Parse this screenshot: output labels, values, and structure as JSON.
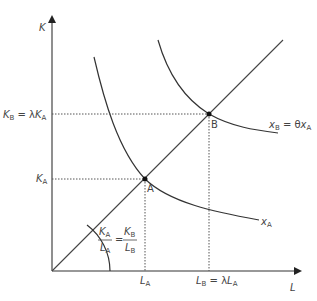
{
  "diagram": {
    "axes": {
      "y_label": "K",
      "x_label": "L"
    },
    "y_ticks": [
      {
        "main": "K",
        "sub": "B",
        "rest": " = λ",
        "main2": "K",
        "sub2": "A"
      },
      {
        "main": "K",
        "sub": "A"
      }
    ],
    "x_ticks": [
      {
        "main": "L",
        "sub": "A"
      },
      {
        "main": "L",
        "sub": "B",
        "rest": " = λ",
        "main2": "L",
        "sub2": "A"
      }
    ],
    "points": [
      {
        "label": "A"
      },
      {
        "label": "B"
      }
    ],
    "curves": [
      {
        "name": "isoquant-A",
        "main": "x",
        "sub": "A"
      },
      {
        "name": "isoquant-B",
        "main": "x",
        "sub": "B",
        "rest": " = θ",
        "main2": "x",
        "sub2": "A"
      }
    ],
    "angle_label": {
      "num1": "K",
      "num1_sub": "A",
      "den1": "L",
      "den1_sub": "A",
      "eq": "=",
      "num2": "K",
      "num2_sub": "B",
      "den2": "L",
      "den2_sub": "B"
    }
  }
}
